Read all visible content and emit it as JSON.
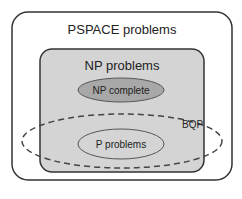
{
  "diagram": {
    "pspace": {
      "label": "PSPACE problems",
      "fill": "#ffffff",
      "stroke": "#333333"
    },
    "np": {
      "label": "NP problems",
      "fill": "#d4d4d4",
      "stroke": "#333333"
    },
    "np_complete": {
      "label": "NP complete",
      "fill": "#a8a8a8",
      "stroke": "#555555"
    },
    "p": {
      "label": "P problems",
      "fill": "#d4d4d4",
      "stroke": "#555555"
    },
    "bqp": {
      "label": "BQP",
      "stroke": "#444444",
      "style": "dashed"
    }
  }
}
